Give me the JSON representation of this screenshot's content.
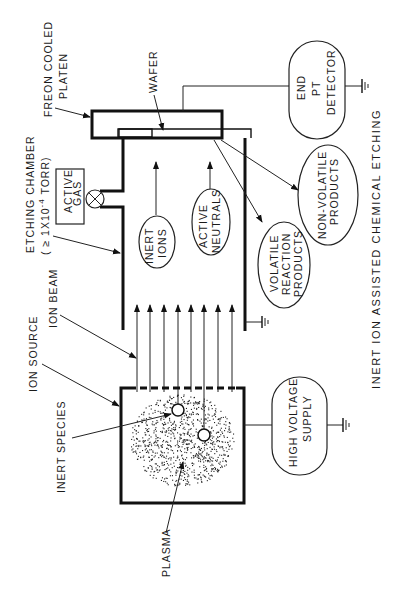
{
  "diagram": {
    "title": "INERT ION ASSISTED CHEMICAL ETCHING",
    "labels": {
      "freon_cooled": "FREON COOLED",
      "platen": "PLATEN",
      "wafer": "WAFER",
      "etching_chamber": "ETCHING CHAMBER",
      "pressure": "( ≥ 1X10",
      "pressure_exp": "-4",
      "pressure_unit": " TORR)",
      "ion_beam": "ION BEAM",
      "ion_source": "ION SOURCE",
      "inert_species": "INERT  SPECIES",
      "plasma": "PLASMA"
    },
    "nodes": {
      "end_pt_detector": [
        "END",
        "PT",
        "DETECTOR"
      ],
      "active_gas": [
        "ACTIVE",
        "GAS"
      ],
      "inert_ions": [
        "INERT",
        "IONS"
      ],
      "active_neutrals": [
        "ACTIVE",
        "NEUTRALS"
      ],
      "volatile_reaction_products": [
        "VOLATILE",
        "REACTION",
        "PRODUCTS"
      ],
      "non_volatile_products": [
        "NON-VOLATILE",
        "PRODUCTS"
      ],
      "high_voltage_supply": [
        "HIGH VOLTAGE",
        "SUPPLY"
      ]
    },
    "colors": {
      "ink": "#111111",
      "background": "#ffffff"
    }
  }
}
